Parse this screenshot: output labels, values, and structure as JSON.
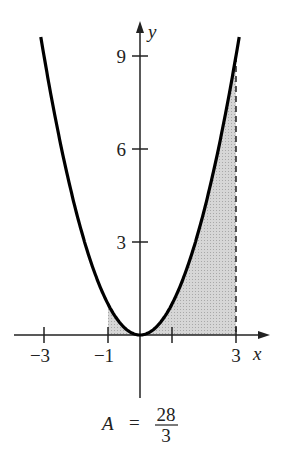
{
  "chart_data": {
    "type": "area",
    "title": "",
    "function": "y = x^2",
    "curve": {
      "x": [
        -3.1,
        -3,
        -2.5,
        -2,
        -1.5,
        -1,
        -0.5,
        0,
        0.5,
        1,
        1.5,
        2,
        2.5,
        3,
        3.1
      ],
      "y": [
        9.61,
        9,
        6.25,
        4,
        2.25,
        1,
        0.25,
        0,
        0.25,
        1,
        2.25,
        4,
        6.25,
        9,
        9.61
      ]
    },
    "shaded_region": {
      "from_x": -1,
      "to_x": 3,
      "between": "curve and x-axis"
    },
    "xlabel": "x",
    "ylabel": "y",
    "x_ticks": [
      -3,
      -1,
      1,
      3
    ],
    "x_tick_labels": [
      "−3",
      "−1",
      "",
      "3"
    ],
    "y_ticks": [
      3,
      6,
      9
    ],
    "y_tick_labels": [
      "3",
      "6",
      "9"
    ],
    "xlim": [
      -3.1,
      4
    ],
    "ylim": [
      -2,
      10
    ],
    "grid": false,
    "annotation": {
      "lhs": "A",
      "eq": "=",
      "numerator": "28",
      "denominator": "3"
    },
    "dashed_line_x": 3
  }
}
